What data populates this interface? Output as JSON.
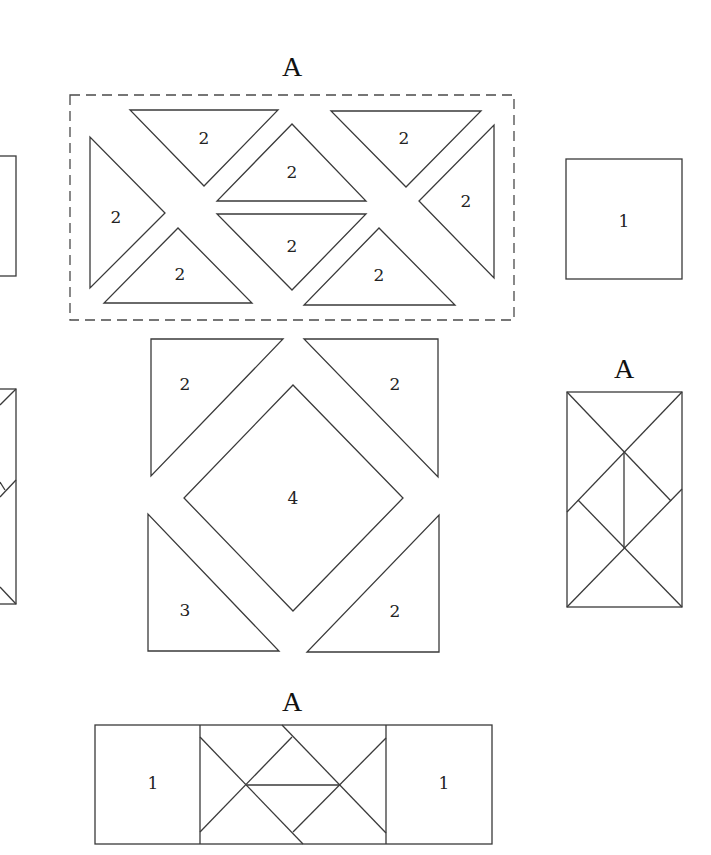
{
  "diagram": {
    "titles": [
      {
        "text": "A",
        "x": 292,
        "y": 66
      },
      {
        "text": "A",
        "x": 624,
        "y": 368
      },
      {
        "text": "A",
        "x": 292,
        "y": 701
      }
    ],
    "top_group": {
      "dashed_box": {
        "x": 70,
        "y": 95,
        "w": 444,
        "h": 225
      },
      "triangles": [
        {
          "points": "130,110 278,110 204,186",
          "label": "2",
          "lx": 204,
          "ly": 138
        },
        {
          "points": "90,137 90,288 165,213",
          "label": "2",
          "lx": 116,
          "ly": 217
        },
        {
          "points": "104,303 252,303 178,228",
          "label": "2",
          "lx": 180,
          "ly": 274
        },
        {
          "points": "292,124 217,201 366,201",
          "label": "2",
          "lx": 292,
          "ly": 172
        },
        {
          "points": "217,214 366,214 292,290",
          "label": "2",
          "lx": 292,
          "ly": 246
        },
        {
          "points": "331,111 481,111 406,187",
          "label": "2",
          "lx": 404,
          "ly": 138
        },
        {
          "points": "494,125 494,278 419,201",
          "label": "2",
          "lx": 466,
          "ly": 201
        },
        {
          "points": "379,228 304,305 455,305",
          "label": "2",
          "lx": 379,
          "ly": 275
        }
      ]
    },
    "middle_group": {
      "shapes": [
        {
          "points": "151,339 283,339 151,476",
          "label": "2",
          "lx": 185,
          "ly": 384
        },
        {
          "points": "304,339 438,339 438,477",
          "label": "2",
          "lx": 395,
          "ly": 384
        },
        {
          "points": "293,385 403,498 293,611 184,498",
          "label": "4",
          "lx": 293,
          "ly": 498
        },
        {
          "points": "148,514 148,651 279,651",
          "label": "3",
          "lx": 185,
          "ly": 610
        },
        {
          "points": "439,515 439,652 307,652",
          "label": "2",
          "lx": 395,
          "ly": 611
        }
      ]
    },
    "right_square": {
      "x": 566,
      "y": 159,
      "w": 116,
      "h": 120,
      "label": "1",
      "lx": 624,
      "ly": 221
    },
    "right_rect": {
      "x": 567,
      "y": 392,
      "w": 115,
      "h": 215,
      "lines": [
        {
          "x1": 567,
          "y1": 392,
          "x2": 671,
          "y2": 501
        },
        {
          "x1": 682,
          "y1": 392,
          "x2": 567,
          "y2": 512
        },
        {
          "x1": 624,
          "y1": 453,
          "x2": 624,
          "y2": 548
        },
        {
          "x1": 578,
          "y1": 500,
          "x2": 682,
          "y2": 607
        },
        {
          "x1": 682,
          "y1": 489,
          "x2": 567,
          "y2": 607
        }
      ]
    },
    "left_partial_square": {
      "x": -110,
      "y": 156,
      "w": 126,
      "h": 120
    },
    "left_partial_rect": {
      "x": -110,
      "y": 389,
      "w": 126,
      "h": 215,
      "lines": [
        {
          "x1": 16,
          "y1": 389,
          "x2": 0,
          "y2": 405
        },
        {
          "x1": 16,
          "y1": 480,
          "x2": 0,
          "y2": 497
        },
        {
          "x1": 0,
          "y1": 482,
          "x2": 5,
          "y2": 490
        },
        {
          "x1": 0,
          "y1": 587,
          "x2": 16,
          "y2": 604
        }
      ]
    },
    "bottom_rect": {
      "x": 95,
      "y": 725,
      "w": 397,
      "h": 119,
      "dividers": [
        200,
        386
      ],
      "left_label": {
        "text": "1",
        "x": 153,
        "y": 783
      },
      "right_label": {
        "text": "1",
        "x": 444,
        "y": 783
      },
      "lines": [
        {
          "x1": 200,
          "y1": 737,
          "x2": 303,
          "y2": 844
        },
        {
          "x1": 200,
          "y1": 832,
          "x2": 292,
          "y2": 737
        },
        {
          "x1": 282,
          "y1": 725,
          "x2": 386,
          "y2": 833
        },
        {
          "x1": 293,
          "y1": 832,
          "x2": 386,
          "y2": 738
        },
        {
          "x1": 247,
          "y1": 785,
          "x2": 339,
          "y2": 785
        }
      ]
    }
  }
}
